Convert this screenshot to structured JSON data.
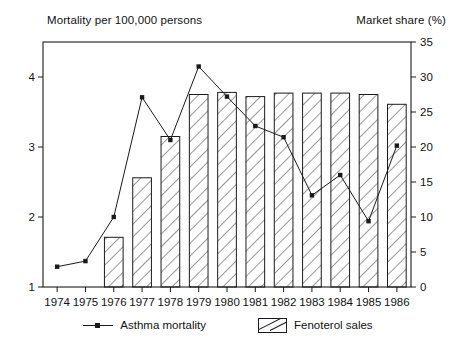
{
  "chart_data": {
    "type": "bar",
    "title": "",
    "categories": [
      "1974",
      "1975",
      "1976",
      "1977",
      "1978",
      "1979",
      "1980",
      "1981",
      "1982",
      "1983",
      "1984",
      "1985",
      "1986"
    ],
    "xlabel": "",
    "ylabel": "Mortality per 100,000 persons",
    "y2label": "Market share (%)",
    "ylim": [
      1,
      4.5
    ],
    "yticks": [
      1,
      2,
      3,
      4
    ],
    "y2lim": [
      0,
      35
    ],
    "y2ticks": [
      0,
      5,
      10,
      15,
      20,
      25,
      30,
      35
    ],
    "grid": false,
    "legend_position": "bottom",
    "series": [
      {
        "name": "Fenoterol sales",
        "type": "bar",
        "axis": "right",
        "fill": "diagonal-hatch",
        "values": [
          0,
          0,
          7.1,
          15.6,
          21.5,
          27.5,
          27.8,
          27.2,
          27.7,
          27.7,
          27.7,
          27.5,
          26.1
        ]
      },
      {
        "name": "Asthma mortality",
        "type": "line",
        "axis": "left",
        "marker": "square",
        "values": [
          1.29,
          1.37,
          2.0,
          3.71,
          3.1,
          4.15,
          3.72,
          3.3,
          3.14,
          2.31,
          2.6,
          1.94,
          3.02
        ]
      }
    ]
  },
  "legend": {
    "items": [
      {
        "label": "Asthma mortality",
        "marker": "line-marker"
      },
      {
        "label": "Fenoterol sales",
        "marker": "hatched-box"
      }
    ]
  },
  "colors": {
    "ink": "#1a1a1a",
    "background": "#ffffff"
  }
}
